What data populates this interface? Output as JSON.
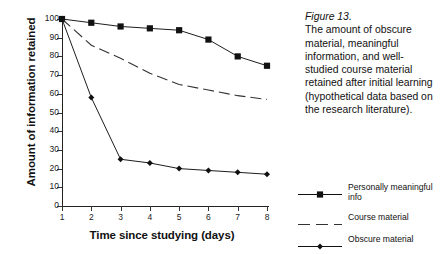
{
  "caption": {
    "figure_number": "Figure 13.",
    "text": "The amount of obscure material, meaningful information, and well-studied course material retained after initial learning (hypothetical data based on the research literature)."
  },
  "legend": {
    "position": "right",
    "items": [
      {
        "label": "Personally meaningful info",
        "marker": "square",
        "line": "solid",
        "color": "#111111"
      },
      {
        "label": "Course material",
        "marker": "none",
        "line": "dashed",
        "color": "#333333"
      },
      {
        "label": "Obscure material",
        "marker": "diamond",
        "line": "solid",
        "color": "#111111"
      }
    ]
  },
  "chart_data": {
    "type": "line",
    "title": "",
    "xlabel": "Time since studying (days)",
    "ylabel": "Amount of information retained",
    "x": [
      1,
      2,
      3,
      4,
      5,
      6,
      7,
      8
    ],
    "xtick_labels": [
      "1",
      "2",
      "3",
      "4",
      "5",
      "6",
      "7",
      "8"
    ],
    "ytick_labels": [
      "0",
      "10",
      "20",
      "30",
      "40",
      "50",
      "60",
      "70",
      "80",
      "90",
      "100"
    ],
    "yticks": [
      0,
      10,
      20,
      30,
      40,
      50,
      60,
      70,
      80,
      90,
      100
    ],
    "xlim": [
      1,
      8
    ],
    "ylim": [
      0,
      100
    ],
    "grid": false,
    "series": [
      {
        "name": "Personally meaningful info",
        "marker": "square",
        "line": "solid",
        "color": "#111111",
        "values": [
          100,
          98,
          96,
          95,
          94,
          89,
          80,
          75
        ]
      },
      {
        "name": "Course material",
        "marker": "none",
        "line": "dashed",
        "color": "#333333",
        "values": [
          100,
          86,
          79,
          71,
          65,
          62,
          59,
          57
        ]
      },
      {
        "name": "Obscure material",
        "marker": "diamond",
        "line": "solid",
        "color": "#111111",
        "values": [
          100,
          58,
          25,
          23,
          20,
          19,
          18,
          17
        ]
      }
    ]
  }
}
